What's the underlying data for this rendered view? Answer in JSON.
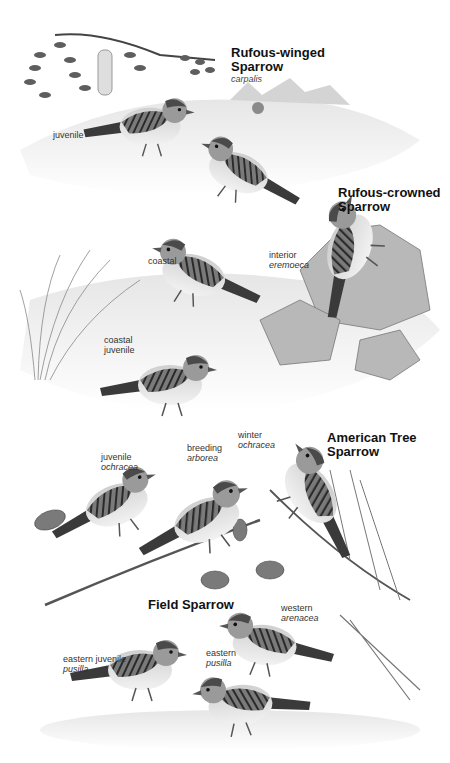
{
  "page": {
    "plates": [
      {
        "species": "Rufous-winged Sparrow",
        "species_line1": "Rufous-winged",
        "species_line2": "Sparrow",
        "subspecies": "carpalis",
        "labels": [
          {
            "text": "juvenile"
          }
        ]
      },
      {
        "species": "Rufous-crowned Sparrow",
        "species_line1": "Rufous-crowned",
        "species_line2": "Sparrow",
        "labels": [
          {
            "line1": "coastal"
          },
          {
            "line1": "interior",
            "line2": "eremoeca"
          },
          {
            "line1": "coastal",
            "line2": "juvenile"
          }
        ]
      },
      {
        "species": "American Tree Sparrow",
        "species_line1": "American Tree",
        "species_line2": "Sparrow",
        "labels": [
          {
            "line1": "juvenile",
            "line2": "ochracea"
          },
          {
            "line1": "breeding",
            "line2": "arborea"
          },
          {
            "line1": "winter",
            "line2": "ochracea"
          }
        ]
      },
      {
        "species": "Field Sparrow",
        "species_line1": "Field Sparrow",
        "labels": [
          {
            "line1": "western",
            "line2": "arenacea"
          },
          {
            "line1": "eastern juvenile",
            "line2": "pusilla"
          },
          {
            "line1": "eastern",
            "line2": "pusilla"
          }
        ]
      }
    ]
  }
}
